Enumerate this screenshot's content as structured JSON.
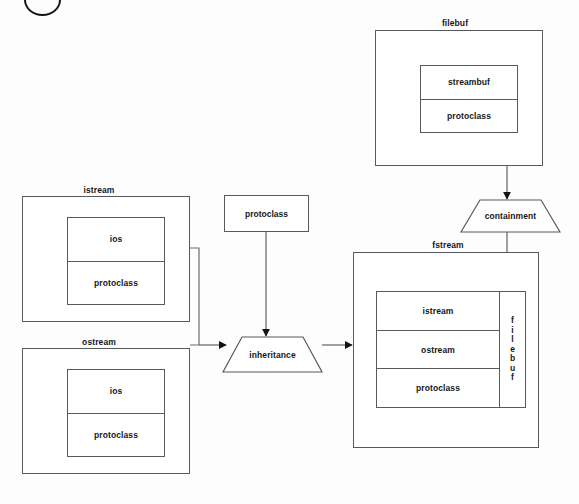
{
  "diagram": {
    "type": "uml-class-diagram",
    "stroke_color": "#555a5f",
    "text_color": "#15181b",
    "background": "#fdfdfd"
  },
  "boxes": {
    "istream": {
      "label": "istream",
      "members": [
        "ios",
        "protoclass"
      ]
    },
    "ostream": {
      "label": "ostream",
      "members": [
        "ios",
        "protoclass"
      ]
    },
    "protoclass": {
      "label": "protoclass"
    },
    "filebuf": {
      "label": "filebuf",
      "members": [
        "streambuf",
        "protoclass"
      ]
    },
    "fstream": {
      "label": "fstream",
      "members": [
        "istream",
        "ostream",
        "protoclass"
      ],
      "side_member": "filebuf",
      "side_member_letters": [
        "f",
        "i",
        "l",
        "e",
        "b",
        "u",
        "f"
      ]
    }
  },
  "relations": {
    "inheritance": {
      "label": "inheritance",
      "shape": "trapezoid"
    },
    "containment": {
      "label": "containment",
      "shape": "trapezoid"
    }
  },
  "connectors": [
    {
      "name": "istream-ostream-bracket-to-inheritance",
      "kind": "bracket-arrow"
    },
    {
      "name": "protoclass-down-to-inheritance",
      "kind": "arrow"
    },
    {
      "name": "inheritance-right-to-fstream",
      "kind": "arrow"
    },
    {
      "name": "filebuf-down-to-containment",
      "kind": "arrow"
    },
    {
      "name": "containment-down-to-fstream-filebuf",
      "kind": "arrow"
    }
  ],
  "marks": {
    "arc": "partial-circle-mark"
  }
}
